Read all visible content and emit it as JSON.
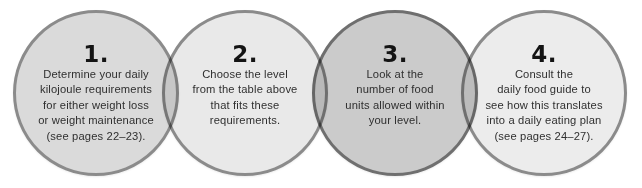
{
  "steps": [
    {
      "number": "1.",
      "text": "Determine your daily\nkilojoule requirements\nfor either weight loss\nor weight maintenance\n(see pages 22–23).",
      "fill": "#dadada",
      "border": "#8b8b8b"
    },
    {
      "number": "2.",
      "text": "Choose the level\nfrom the table above\nthat fits these\nrequirements.",
      "fill": "#e9e9e9",
      "border": "#8b8b8b"
    },
    {
      "number": "3.",
      "text": "Look at the\nnumber of food\nunits allowed within\nyour level.",
      "fill": "#cbcbcb",
      "border": "#6f6f6f"
    },
    {
      "number": "4.",
      "text": "Consult the\ndaily food guide to\nsee how this translates\ninto a daily eating plan\n(see pages 24–27).",
      "fill": "#ececec",
      "border": "#8b8b8b"
    }
  ]
}
